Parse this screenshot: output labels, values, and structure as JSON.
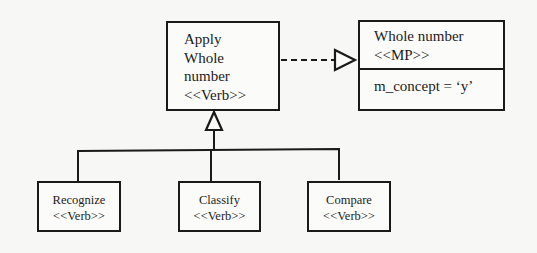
{
  "diagram": {
    "type": "uml-class-diagram",
    "colors": {
      "stroke": "#1a1a1a",
      "background": "#f7f7f5",
      "box_fill": "#fbfbfa"
    },
    "parent": {
      "lines": [
        "Apply",
        "Whole",
        "number",
        "<<Verb>>"
      ],
      "name": "Apply Whole number",
      "stereotype": "<<Verb>>"
    },
    "realized_class": {
      "name": "Whole number",
      "stereotype": "<<MP>>",
      "attribute": "m_concept = ‘y’"
    },
    "children": [
      {
        "name": "Recognize",
        "stereotype": "<<Verb>>"
      },
      {
        "name": "Classify",
        "stereotype": "<<Verb>>"
      },
      {
        "name": "Compare",
        "stereotype": "<<Verb>>"
      }
    ],
    "relations": [
      {
        "from": "Apply Whole number",
        "to": "Whole number",
        "kind": "realization",
        "style": "dashed-hollow-triangle"
      },
      {
        "from": "Recognize",
        "to": "Apply Whole number",
        "kind": "generalization",
        "style": "solid-hollow-triangle"
      },
      {
        "from": "Classify",
        "to": "Apply Whole number",
        "kind": "generalization",
        "style": "solid-hollow-triangle"
      },
      {
        "from": "Compare",
        "to": "Apply Whole number",
        "kind": "generalization",
        "style": "solid-hollow-triangle"
      }
    ]
  }
}
